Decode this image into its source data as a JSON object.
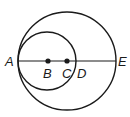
{
  "diagram": {
    "type": "geometry",
    "stroke_color": "#1a1a1a",
    "large_circle": {
      "cx": 67,
      "cy": 61,
      "r": 49
    },
    "small_circle": {
      "cx": 47,
      "cy": 61,
      "r": 29
    },
    "segment": {
      "x1": 18,
      "y1": 61,
      "x2": 116,
      "y2": 61
    },
    "points": [
      {
        "label": "A",
        "x": 18,
        "y": 61,
        "dot": false
      },
      {
        "label": "B",
        "x": 48,
        "y": 61,
        "dot": true
      },
      {
        "label": "C",
        "x": 67,
        "y": 61,
        "dot": true
      },
      {
        "label": "D",
        "x": 76,
        "y": 61,
        "dot": false
      },
      {
        "label": "E",
        "x": 116,
        "y": 61,
        "dot": false
      }
    ]
  }
}
